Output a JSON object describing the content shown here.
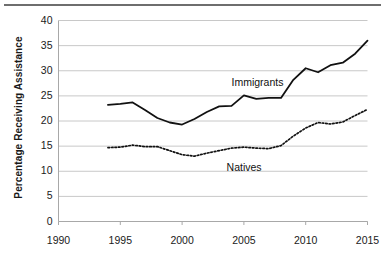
{
  "chart_data": {
    "type": "line",
    "title": "",
    "xlabel": "",
    "ylabel": "Percentage Receiving Assistance",
    "xlim": [
      1990,
      2015
    ],
    "ylim": [
      0,
      40
    ],
    "grid": "horizontal",
    "legend_position": "inline-annotations",
    "xticks": [
      1990,
      1995,
      2000,
      2005,
      2010,
      2015
    ],
    "yticks": [
      0,
      5,
      10,
      15,
      20,
      25,
      30,
      35,
      40
    ],
    "x": [
      1994,
      1995,
      1996,
      1997,
      1998,
      1999,
      2000,
      2001,
      2002,
      2003,
      2004,
      2005,
      2006,
      2007,
      2008,
      2009,
      2010,
      2011,
      2012,
      2013,
      2014,
      2015
    ],
    "series": [
      {
        "name": "Immigrants",
        "style": "solid",
        "color": "#111111",
        "values": [
          23.2,
          23.4,
          23.7,
          22.2,
          20.6,
          19.7,
          19.3,
          20.4,
          21.8,
          22.9,
          23.0,
          25.1,
          24.4,
          24.6,
          24.6,
          28.2,
          30.5,
          29.7,
          31.1,
          31.6,
          33.4,
          36.0
        ]
      },
      {
        "name": "Natives",
        "style": "dotted",
        "color": "#111111",
        "values": [
          14.7,
          14.8,
          15.2,
          14.9,
          14.9,
          14.1,
          13.3,
          13.0,
          13.6,
          14.1,
          14.6,
          14.8,
          14.6,
          14.5,
          15.1,
          17.0,
          18.6,
          19.7,
          19.4,
          19.8,
          21.1,
          22.3
        ]
      }
    ],
    "annotations": [
      {
        "text": "Immigrants",
        "x": 2004.0,
        "y": 27.6
      },
      {
        "text": "Natives",
        "x": 2003.6,
        "y": 10.6
      }
    ]
  },
  "axis": {
    "y_title": "Percentage Receiving Assistance",
    "y_labels": [
      "40",
      "35",
      "30",
      "25",
      "20",
      "15",
      "10",
      "5",
      "0"
    ],
    "x_labels": [
      "1990",
      "1995",
      "2000",
      "2005",
      "2010",
      "2015"
    ]
  },
  "annotations": {
    "immigrants_label": "Immigrants",
    "natives_label": "Natives"
  },
  "colors": {
    "series_line": "#111111",
    "gridline": "#c8c8c8",
    "axis_line": "#a8a8a8",
    "top_rule": "#6e6e6e",
    "text": "#1a1a1a",
    "background": "#ffffff"
  }
}
